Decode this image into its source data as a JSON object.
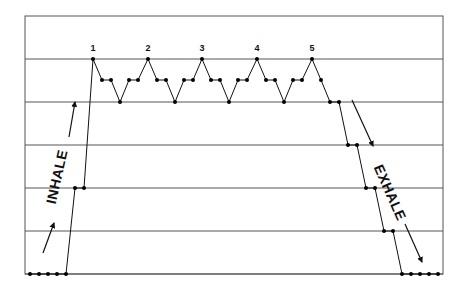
{
  "diagram": {
    "type": "breath-hold waveform",
    "frame": {
      "left": 25,
      "top": 16,
      "right": 443,
      "bottom": 274
    },
    "gridlines_y": [
      59,
      102,
      145,
      188,
      231,
      274
    ],
    "colors": {
      "line": "#111111",
      "grid": "#444444",
      "dot": "#000000",
      "background": "#ffffff"
    },
    "peak_labels": [
      {
        "text": "1",
        "x": 93,
        "y": 51
      },
      {
        "text": "2",
        "x": 148,
        "y": 51
      },
      {
        "text": "3",
        "x": 202,
        "y": 51
      },
      {
        "text": "4",
        "x": 257,
        "y": 51
      },
      {
        "text": "5",
        "x": 312,
        "y": 51
      }
    ],
    "inhale_label": {
      "text": "INHALE",
      "x": 58,
      "y": 177,
      "rotate": -77
    },
    "exhale_label": {
      "text": "EXHALE",
      "x": 389,
      "y": 193,
      "rotate": 66
    },
    "main_path": [
      [
        30,
        274
      ],
      [
        39,
        274
      ],
      [
        48,
        274
      ],
      [
        57,
        274
      ],
      [
        66,
        274
      ],
      [
        75,
        188
      ],
      [
        84,
        188
      ],
      [
        93,
        59
      ],
      [
        102,
        80
      ],
      [
        111,
        80
      ],
      [
        120,
        102
      ],
      [
        129,
        80
      ],
      [
        138,
        80
      ],
      [
        148,
        59
      ],
      [
        157,
        80
      ],
      [
        166,
        80
      ],
      [
        175,
        102
      ],
      [
        184,
        80
      ],
      [
        193,
        80
      ],
      [
        202,
        59
      ],
      [
        211,
        80
      ],
      [
        220,
        80
      ],
      [
        229,
        102
      ],
      [
        238,
        80
      ],
      [
        247,
        80
      ],
      [
        257,
        59
      ],
      [
        266,
        80
      ],
      [
        275,
        80
      ],
      [
        284,
        102
      ],
      [
        293,
        80
      ],
      [
        302,
        80
      ],
      [
        312,
        59
      ],
      [
        321,
        80
      ],
      [
        330,
        102
      ],
      [
        339,
        102
      ],
      [
        348,
        145
      ],
      [
        357,
        145
      ],
      [
        366,
        188
      ],
      [
        375,
        188
      ],
      [
        384,
        231
      ],
      [
        393,
        231
      ],
      [
        402,
        274
      ],
      [
        411,
        274
      ],
      [
        420,
        274
      ],
      [
        429,
        274
      ],
      [
        438,
        274
      ]
    ],
    "inhale_arrows": [
      {
        "from": [
          43,
          253
        ],
        "to": [
          54,
          223
        ]
      },
      {
        "from": [
          69,
          137
        ],
        "to": [
          75,
          102
        ]
      }
    ],
    "exhale_arrows": [
      {
        "from": [
          352,
          100
        ],
        "to": [
          373,
          146
        ]
      },
      {
        "from": [
          405,
          224
        ],
        "to": [
          422,
          262
        ]
      }
    ]
  }
}
